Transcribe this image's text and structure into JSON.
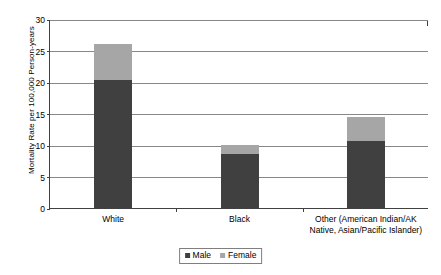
{
  "chart_data": {
    "type": "bar",
    "subtype": "stacked-vertical",
    "title": "",
    "xlabel": "",
    "ylabel": "Mortality Rate per 100,000 Person-years",
    "ylim": [
      0,
      30
    ],
    "ytick_step": 5,
    "yticks": [
      "0",
      "5",
      "10",
      "15",
      "20",
      "25",
      "30"
    ],
    "grid": "horizontal",
    "legend_position": "bottom-center",
    "categories": [
      "White",
      "Black",
      "Other (American Indian/AK\nNative, Asian/Pacific Islander)"
    ],
    "series": [
      {
        "name": "Male",
        "color": "#404040",
        "values": [
          20.3,
          8.5,
          10.6
        ]
      },
      {
        "name": "Female",
        "color": "#a6a6a6",
        "values": [
          5.7,
          1.5,
          3.8
        ]
      }
    ],
    "totals": [
      26.0,
      10.0,
      14.4
    ]
  },
  "legend": {
    "items": [
      {
        "label": "Male",
        "color": "#404040"
      },
      {
        "label": "Female",
        "color": "#a6a6a6"
      }
    ]
  },
  "colors": {
    "male": "#404040",
    "female": "#a6a6a6",
    "gridline": "#888888",
    "axis": "#404040",
    "background": "#ffffff"
  }
}
